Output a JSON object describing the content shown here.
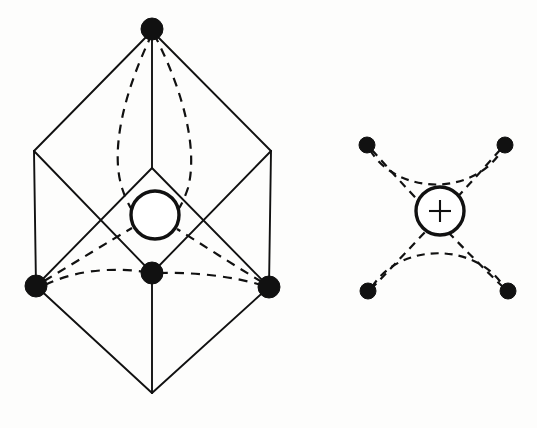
{
  "figure": {
    "title": "",
    "background_color": "#fdfdfc",
    "ink_color": "#111111",
    "width": 537,
    "height": 428,
    "panels": [
      {
        "id": "left-panel",
        "name": "rhombohedral-unit-cell",
        "description": "Rhombohedral unit cell outline with central circle and four filled coordinating atoms joined by dashed bonds",
        "outline_style": "solid",
        "bond_style": "dashed",
        "central_atom": {
          "label": "",
          "cx": 155,
          "cy": 215,
          "r": 25,
          "has_plus": false
        },
        "vertices": [
          {
            "name": "top-apex",
            "cx": 152,
            "cy": 29,
            "r": 11,
            "filled": true
          },
          {
            "name": "upper-left-edge",
            "cx": 34,
            "cy": 151,
            "r": 0,
            "filled": false
          },
          {
            "name": "upper-right-edge",
            "cx": 271,
            "cy": 151,
            "r": 0,
            "filled": false
          },
          {
            "name": "left-atom",
            "cx": 36,
            "cy": 286,
            "r": 11,
            "filled": true
          },
          {
            "name": "center-atom",
            "cx": 152,
            "cy": 273,
            "r": 11,
            "filled": true
          },
          {
            "name": "right-atom",
            "cx": 269,
            "cy": 287,
            "r": 11,
            "filled": true
          },
          {
            "name": "bottom-apex",
            "cx": 152,
            "cy": 393,
            "r": 0,
            "filled": false
          },
          {
            "name": "inner-mid-vertex",
            "cx": 152,
            "cy": 168,
            "r": 0,
            "filled": false
          }
        ]
      },
      {
        "id": "right-panel",
        "name": "coordination-polyhedron",
        "description": "Isolated coordination unit: central cation circle marked with a plus, four filled anions joined by dashed bonds crossing in a star pattern",
        "outline_style": "none",
        "bond_style": "dashed",
        "central_atom": {
          "label": "+",
          "cx": 440,
          "cy": 211,
          "r": 25,
          "has_plus": true
        },
        "vertices": [
          {
            "name": "top-left-atom",
            "cx": 367,
            "cy": 145,
            "r": 8,
            "filled": true
          },
          {
            "name": "top-right-atom",
            "cx": 505,
            "cy": 145,
            "r": 8,
            "filled": true
          },
          {
            "name": "bottom-left-atom",
            "cx": 368,
            "cy": 291,
            "r": 8,
            "filled": true
          },
          {
            "name": "bottom-right-atom",
            "cx": 508,
            "cy": 291,
            "r": 8,
            "filled": true
          }
        ]
      }
    ]
  },
  "chart_data": {
    "type": "diagram",
    "title": "",
    "subtitle": "",
    "xlabel": "",
    "ylabel": "",
    "legend": [],
    "annotations": [
      {
        "text": "+",
        "x": 440,
        "y": 211,
        "target": "right-panel central cation"
      }
    ],
    "series": [
      {
        "name": "left-cell-solid-edges",
        "kind": "polyline-set",
        "values": [
          [
            [
              152,
              29
            ],
            [
              34,
              151
            ]
          ],
          [
            [
              152,
              29
            ],
            [
              271,
              151
            ]
          ],
          [
            [
              152,
              29
            ],
            [
              152,
              168
            ]
          ],
          [
            [
              34,
              151
            ],
            [
              152,
              273
            ]
          ],
          [
            [
              271,
              151
            ],
            [
              152,
              273
            ]
          ],
          [
            [
              34,
              151
            ],
            [
              36,
              286
            ]
          ],
          [
            [
              271,
              151
            ],
            [
              269,
              287
            ]
          ],
          [
            [
              152,
              168
            ],
            [
              36,
              286
            ]
          ],
          [
            [
              152,
              168
            ],
            [
              269,
              287
            ]
          ],
          [
            [
              36,
              286
            ],
            [
              152,
              393
            ]
          ],
          [
            [
              269,
              287
            ],
            [
              152,
              393
            ]
          ],
          [
            [
              152,
              273
            ],
            [
              152,
              393
            ]
          ]
        ]
      },
      {
        "name": "left-cell-dashed-bonds",
        "kind": "curve-set",
        "values": [
          [
            [
              152,
              29
            ],
            [
              112,
              150
            ],
            [
              140,
              205
            ]
          ],
          [
            [
              152,
              29
            ],
            [
              192,
              150
            ],
            [
              168,
              205
            ]
          ],
          [
            [
              36,
              286
            ],
            [
              95,
              250
            ],
            [
              133,
              226
            ]
          ],
          [
            [
              269,
              287
            ],
            [
              212,
              250
            ],
            [
              176,
              226
            ]
          ],
          [
            [
              36,
              286
            ],
            [
              100,
              258
            ],
            [
              152,
              273
            ]
          ],
          [
            [
              152,
              273
            ],
            [
              208,
              262
            ],
            [
              269,
              287
            ]
          ]
        ]
      },
      {
        "name": "right-unit-dashed-bonds",
        "kind": "curve-set",
        "values": [
          [
            [
              367,
              145
            ],
            [
              400,
              200
            ],
            [
              508,
              291
            ]
          ],
          [
            [
              505,
              145
            ],
            [
              470,
              200
            ],
            [
              368,
              291
            ]
          ],
          [
            [
              367,
              145
            ],
            [
              440,
              178
            ],
            [
              505,
              145
            ]
          ],
          [
            [
              368,
              291
            ],
            [
              440,
              258
            ],
            [
              508,
              291
            ]
          ]
        ]
      }
    ]
  }
}
